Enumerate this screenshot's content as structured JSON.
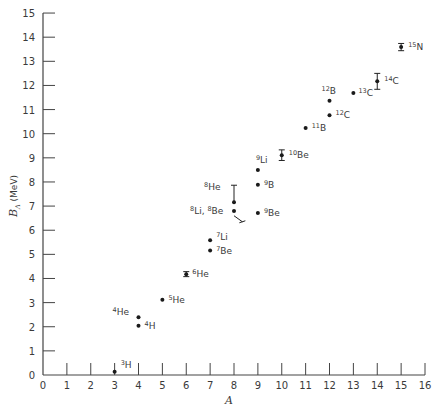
{
  "chart_data": {
    "type": "scatter",
    "title": "",
    "xlabel": "A",
    "ylabel": "B_Λ (MeV)",
    "ylabel_main": "B",
    "ylabel_sub": "Λ",
    "ylabel_unit": " (MeV)",
    "xlim": [
      0,
      16
    ],
    "ylim": [
      0,
      15
    ],
    "grid": false,
    "legend": null,
    "x_ticks": [
      0,
      1,
      2,
      3,
      4,
      5,
      6,
      7,
      8,
      9,
      10,
      11,
      12,
      13,
      14,
      15,
      16
    ],
    "y_ticks": [
      0,
      1,
      2,
      3,
      4,
      5,
      6,
      7,
      8,
      9,
      10,
      11,
      12,
      13,
      14,
      15
    ],
    "points": [
      {
        "nucleus": "3H",
        "mass": "3",
        "element": "H",
        "A": 3,
        "B": 0.13,
        "err": 0,
        "label_dx": 6,
        "label_dy": -4
      },
      {
        "nucleus": "4H",
        "mass": "4",
        "element": "H",
        "A": 4,
        "B": 2.04,
        "err": 0,
        "label_dx": 6,
        "label_dy": 3
      },
      {
        "nucleus": "4He",
        "mass": "4",
        "element": "He",
        "A": 4,
        "B": 2.39,
        "err": 0,
        "label_dx": -26,
        "label_dy": -2
      },
      {
        "nucleus": "5He",
        "mass": "5",
        "element": "He",
        "A": 5,
        "B": 3.12,
        "err": 0,
        "label_dx": 6,
        "label_dy": 3
      },
      {
        "nucleus": "6He",
        "mass": "6",
        "element": "He",
        "A": 6,
        "B": 4.18,
        "err": 0.1,
        "label_dx": 6,
        "label_dy": 3
      },
      {
        "nucleus": "7Li",
        "mass": "7",
        "element": "Li",
        "A": 7,
        "B": 5.58,
        "err": 0,
        "label_dx": 6,
        "label_dy": 0
      },
      {
        "nucleus": "7Be",
        "mass": "7",
        "element": "Be",
        "A": 7,
        "B": 5.16,
        "err": 0,
        "label_dx": 6,
        "label_dy": 4
      },
      {
        "nucleus": "8He",
        "mass": "8",
        "element": "He",
        "A": 8,
        "B": 7.16,
        "err": 0.7,
        "label_dx": -30,
        "label_dy": -12
      },
      {
        "nucleus": "8Li, 8Be",
        "mass": "8",
        "element": "Li, 8Be",
        "A": 8,
        "B": 6.8,
        "err": 0,
        "label_dx": -44,
        "label_dy": 3
      },
      {
        "nucleus": "9Li",
        "mass": "9",
        "element": "Li",
        "A": 9,
        "B": 8.5,
        "err": 0,
        "label_dx": -2,
        "label_dy": -7
      },
      {
        "nucleus": "9B",
        "mass": "9",
        "element": "B",
        "A": 9,
        "B": 7.88,
        "err": 0,
        "label_dx": 6,
        "label_dy": 3
      },
      {
        "nucleus": "9Be",
        "mass": "9",
        "element": "Be",
        "A": 9,
        "B": 6.71,
        "err": 0,
        "label_dx": 6,
        "label_dy": 3
      },
      {
        "nucleus": "10Be",
        "mass": "10",
        "element": "Be",
        "A": 10,
        "B": 9.11,
        "err": 0.22,
        "label_dx": 7,
        "label_dy": 3
      },
      {
        "nucleus": "11B",
        "mass": "11",
        "element": "B",
        "A": 11,
        "B": 10.24,
        "err": 0,
        "label_dx": 6,
        "label_dy": 3
      },
      {
        "nucleus": "12B",
        "mass": "12",
        "element": "B",
        "A": 12,
        "B": 11.37,
        "err": 0,
        "label_dx": -8,
        "label_dy": -7
      },
      {
        "nucleus": "12C",
        "mass": "12",
        "element": "C",
        "A": 12,
        "B": 10.76,
        "err": 0,
        "label_dx": 6,
        "label_dy": 3
      },
      {
        "nucleus": "13C",
        "mass": "13",
        "element": "C",
        "A": 13,
        "B": 11.69,
        "err": 0,
        "label_dx": 5,
        "label_dy": 3
      },
      {
        "nucleus": "14C",
        "mass": "14",
        "element": "C",
        "A": 14,
        "B": 12.17,
        "err": 0.33,
        "label_dx": 7,
        "label_dy": 3
      },
      {
        "nucleus": "15N",
        "mass": "15",
        "element": "N",
        "A": 15,
        "B": 13.59,
        "err": 0.15,
        "label_dx": 7,
        "label_dy": 3
      }
    ],
    "annotations": [
      {
        "type": "slanted-bar",
        "from": {
          "A": 8.0,
          "B": 6.6
        },
        "to": {
          "A": 8.35,
          "B": 6.35
        }
      }
    ]
  },
  "layout": {
    "x0_px": 43,
    "x_per_unit": 23.875,
    "y0_px": 375,
    "y_per_unit": 24.13
  }
}
